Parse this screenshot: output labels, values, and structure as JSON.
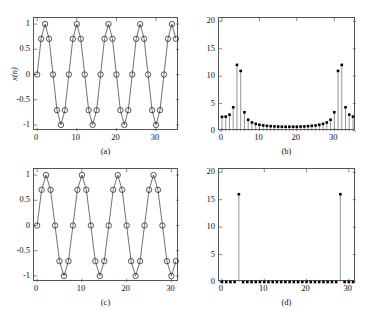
{
  "figure": {
    "width": 365,
    "height": 310,
    "background": "#ffffff",
    "ink": "#111111",
    "axis_color": "#555555"
  },
  "chart_data": [
    {
      "id": "a",
      "type": "line",
      "caption": "(a)",
      "title": "",
      "xlabel": "",
      "ylabel": "x(n)",
      "marker": "open-circle",
      "line": true,
      "xlim": [
        -0.8,
        35.8
      ],
      "ylim": [
        -1.12,
        1.12
      ],
      "xticks": [
        0,
        10,
        20,
        30
      ],
      "xticklabels": [
        "0",
        "10",
        "20",
        "30"
      ],
      "yticks": [
        -1,
        -0.5,
        0,
        0.5,
        1
      ],
      "yticklabels": [
        "-1",
        "-0.5",
        "0",
        "0.5",
        "1"
      ],
      "grid": false,
      "legend": null,
      "x": [
        0,
        1,
        2,
        3,
        4,
        5,
        6,
        7,
        8,
        9,
        10,
        11,
        12,
        13,
        14,
        15,
        16,
        17,
        18,
        19,
        20,
        21,
        22,
        23,
        24,
        25,
        26,
        27,
        28,
        29,
        30,
        31,
        32,
        33,
        34,
        35
      ],
      "values": [
        0,
        0.7071,
        1,
        0.7071,
        0,
        -0.7071,
        -1,
        -0.7071,
        0,
        0.7071,
        1,
        0.7071,
        0,
        -0.7071,
        -1,
        -0.7071,
        0,
        0.7071,
        1,
        0.7071,
        0,
        -0.7071,
        -1,
        -0.7071,
        0,
        0.7071,
        1,
        0.7071,
        0,
        -0.7071,
        -1,
        -0.7071,
        0,
        0.7071,
        1,
        0.7071
      ]
    },
    {
      "id": "b",
      "type": "bar",
      "caption": "(b)",
      "title": "",
      "xlabel": "",
      "ylabel": "",
      "marker": "filled-square",
      "line": false,
      "xlim": [
        -0.8,
        35.8
      ],
      "ylim": [
        0,
        20.6
      ],
      "xticks": [
        0,
        10,
        20,
        30
      ],
      "xticklabels": [
        "0",
        "10",
        "20",
        "30"
      ],
      "yticks": [
        0,
        5,
        10,
        15,
        20
      ],
      "yticklabels": [
        "0",
        "5",
        "10",
        "15",
        "20"
      ],
      "grid": false,
      "legend": null,
      "categories": [
        0,
        1,
        2,
        3,
        4,
        5,
        6,
        7,
        8,
        9,
        10,
        11,
        12,
        13,
        14,
        15,
        16,
        17,
        18,
        19,
        20,
        21,
        22,
        23,
        24,
        25,
        26,
        27,
        28,
        29,
        30,
        31,
        32,
        33,
        34,
        35
      ],
      "values": [
        2.58,
        2.62,
        2.98,
        4.32,
        12.05,
        10.95,
        3.42,
        2.05,
        1.56,
        1.3,
        1.13,
        1.02,
        0.94,
        0.88,
        0.84,
        0.81,
        0.79,
        0.78,
        0.78,
        0.78,
        0.79,
        0.81,
        0.84,
        0.88,
        0.94,
        1.02,
        1.13,
        1.3,
        1.56,
        2.05,
        3.42,
        10.95,
        12.05,
        4.32,
        2.98,
        2.62
      ]
    },
    {
      "id": "c",
      "type": "line",
      "caption": "(c)",
      "title": "",
      "xlabel": "",
      "ylabel": "",
      "marker": "open-circle",
      "line": true,
      "xlim": [
        -0.7,
        31.7
      ],
      "ylim": [
        -1.12,
        1.12
      ],
      "xticks": [
        0,
        10,
        20,
        30
      ],
      "xticklabels": [
        "0",
        "10",
        "20",
        "30"
      ],
      "yticks": [
        -1,
        -0.5,
        0,
        0.5,
        1
      ],
      "yticklabels": [
        "-1",
        "-0.5",
        "0",
        "0.5",
        "1"
      ],
      "grid": false,
      "legend": null,
      "x": [
        0,
        1,
        2,
        3,
        4,
        5,
        6,
        7,
        8,
        9,
        10,
        11,
        12,
        13,
        14,
        15,
        16,
        17,
        18,
        19,
        20,
        21,
        22,
        23,
        24,
        25,
        26,
        27,
        28,
        29,
        30,
        31
      ],
      "values": [
        0,
        0.7071,
        1,
        0.7071,
        0,
        -0.7071,
        -1,
        -0.7071,
        0,
        0.7071,
        1,
        0.7071,
        0,
        -0.7071,
        -1,
        -0.7071,
        0,
        0.7071,
        1,
        0.7071,
        0,
        -0.7071,
        -1,
        -0.7071,
        0,
        0.7071,
        1,
        0.7071,
        0,
        -0.7071,
        -1,
        -0.7071
      ]
    },
    {
      "id": "d",
      "type": "bar",
      "caption": "(d)",
      "title": "",
      "xlabel": "",
      "ylabel": "",
      "marker": "filled-square",
      "line": false,
      "xlim": [
        -0.7,
        31.7
      ],
      "ylim": [
        0,
        20.6
      ],
      "xticks": [
        0,
        10,
        20,
        30
      ],
      "xticklabels": [
        "0",
        "10",
        "20",
        "30"
      ],
      "yticks": [
        0,
        5,
        10,
        15,
        20
      ],
      "yticklabels": [
        "0",
        "5",
        "10",
        "15",
        "20"
      ],
      "grid": false,
      "legend": null,
      "categories": [
        0,
        1,
        2,
        3,
        4,
        5,
        6,
        7,
        8,
        9,
        10,
        11,
        12,
        13,
        14,
        15,
        16,
        17,
        18,
        19,
        20,
        21,
        22,
        23,
        24,
        25,
        26,
        27,
        28,
        29,
        30,
        31
      ],
      "values": [
        0,
        0,
        0,
        0,
        16,
        0,
        0,
        0,
        0,
        0,
        0,
        0,
        0,
        0,
        0,
        0,
        0,
        0,
        0,
        0,
        0,
        0,
        0,
        0,
        0,
        0,
        0,
        0,
        16,
        0,
        0,
        0
      ]
    }
  ]
}
